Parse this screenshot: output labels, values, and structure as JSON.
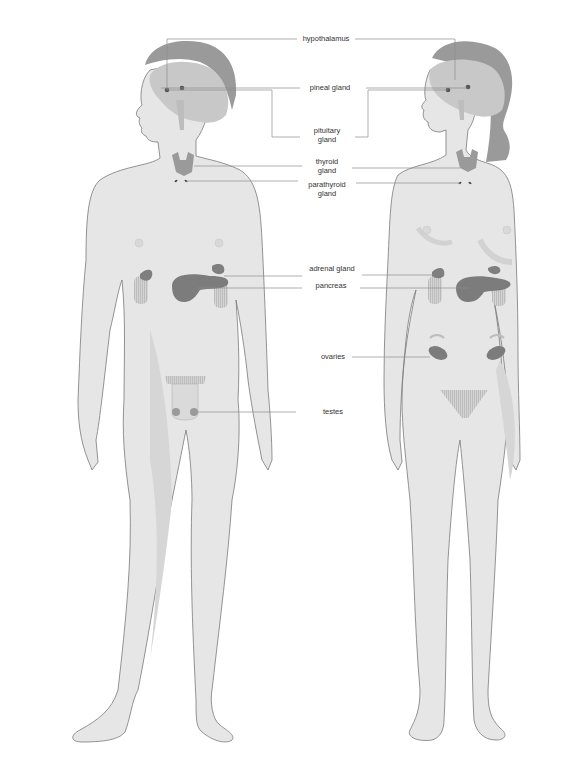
{
  "diagram": {
    "type": "endocrine-system-anatomy",
    "figures": [
      {
        "id": "male",
        "label": "male figure"
      },
      {
        "id": "female",
        "label": "female figure"
      }
    ],
    "labels": {
      "hypothalamus": "hypothalamus",
      "pineal_gland": "pineal gland",
      "pituitary_gland_1": "pituitary",
      "pituitary_gland_2": "gland",
      "thyroid_gland_1": "thyroid",
      "thyroid_gland_2": "gland",
      "parathyroid_gland_1": "parathyroid",
      "parathyroid_gland_2": "gland",
      "adrenal_gland": "adrenal gland",
      "pancreas": "pancreas",
      "ovaries": "ovaries",
      "testes": "testes"
    },
    "colors": {
      "skin": "#e6e6e6",
      "outline": "#7a7a7a",
      "hair": "#9a9a9a",
      "brain": "#c8c8c8",
      "gland": "#8a8a8a",
      "kidney": "#cfcfcf",
      "leader_line": "#8c8c8c"
    }
  }
}
